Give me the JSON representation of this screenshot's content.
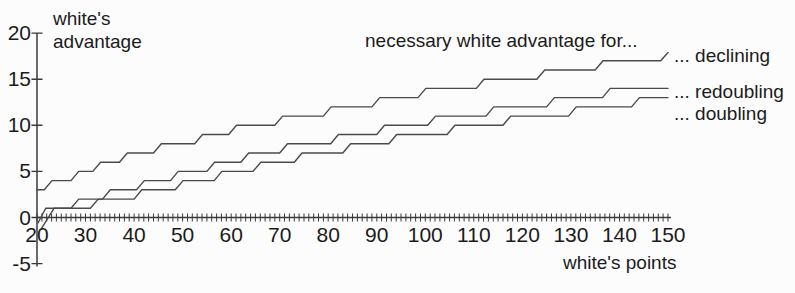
{
  "colors": {
    "background": "#fcfcfc",
    "curve": "#4a4a4a",
    "axis": "#3a3a3a",
    "text": "#1b1b1b"
  },
  "chart_data": {
    "type": "line",
    "title": "necessary white advantage for...",
    "xlabel": "white's points",
    "ylabel_line1": "white's",
    "ylabel_line2": "advantage",
    "xlim": [
      20,
      150
    ],
    "ylim": [
      -5,
      20
    ],
    "grid": false,
    "x_major_ticks": [
      20,
      30,
      40,
      50,
      60,
      70,
      80,
      90,
      100,
      110,
      120,
      130,
      140,
      150
    ],
    "x_major_tick_labels": [
      "20",
      "30",
      "40",
      "50",
      "60",
      "70",
      "80",
      "90",
      "100",
      "110",
      "120",
      "130",
      "140",
      "150"
    ],
    "x_minor_tick_step": 1,
    "y_ticks": [
      20,
      15,
      10,
      5,
      0,
      -5
    ],
    "y_tick_labels": [
      "20",
      "15",
      "10",
      "5",
      "0",
      "-5"
    ],
    "legend_position": "right of curve ends",
    "series": [
      {
        "name": "declining",
        "label": "... declining",
        "points": [
          [
            20,
            3
          ],
          [
            21.5,
            3
          ],
          [
            23.1,
            4
          ],
          [
            27,
            4
          ],
          [
            28.6,
            5
          ],
          [
            31.5,
            5
          ],
          [
            33.1,
            6
          ],
          [
            37,
            6
          ],
          [
            38.6,
            7
          ],
          [
            44,
            7
          ],
          [
            45.6,
            8
          ],
          [
            52.5,
            8
          ],
          [
            54.1,
            9
          ],
          [
            59.5,
            9
          ],
          [
            61.1,
            10
          ],
          [
            69,
            10
          ],
          [
            70.6,
            11
          ],
          [
            79,
            11
          ],
          [
            80.6,
            12
          ],
          [
            89,
            12
          ],
          [
            90.6,
            13
          ],
          [
            98.5,
            13
          ],
          [
            100.1,
            14
          ],
          [
            110.5,
            14
          ],
          [
            112.1,
            15
          ],
          [
            123,
            15
          ],
          [
            124.6,
            16
          ],
          [
            135,
            16
          ],
          [
            136.6,
            17
          ],
          [
            148.5,
            17
          ],
          [
            150,
            17.9
          ]
        ]
      },
      {
        "name": "redoubling",
        "label": "... redoubling",
        "points": [
          [
            20.2,
            -0.6
          ],
          [
            21.8,
            1
          ],
          [
            27,
            1
          ],
          [
            28.6,
            2
          ],
          [
            33.5,
            2
          ],
          [
            35.1,
            3
          ],
          [
            40.5,
            3
          ],
          [
            42.1,
            4
          ],
          [
            47.5,
            4
          ],
          [
            49.1,
            5
          ],
          [
            55,
            5
          ],
          [
            56.6,
            6
          ],
          [
            62,
            6
          ],
          [
            63.6,
            7
          ],
          [
            70,
            7
          ],
          [
            71.6,
            8
          ],
          [
            80.5,
            8
          ],
          [
            82.1,
            9
          ],
          [
            90,
            9
          ],
          [
            91.6,
            10
          ],
          [
            100.5,
            10
          ],
          [
            102.1,
            11
          ],
          [
            112.5,
            11
          ],
          [
            114.1,
            12
          ],
          [
            125,
            12
          ],
          [
            126.6,
            13
          ],
          [
            136.5,
            13
          ],
          [
            138.1,
            14
          ],
          [
            150,
            14
          ]
        ]
      },
      {
        "name": "doubling",
        "label": "... doubling",
        "points": [
          [
            20.9,
            -1.2
          ],
          [
            23.5,
            1
          ],
          [
            31,
            1
          ],
          [
            32.6,
            2
          ],
          [
            40,
            2
          ],
          [
            41.6,
            3
          ],
          [
            48.5,
            3
          ],
          [
            50.1,
            4
          ],
          [
            56.5,
            4
          ],
          [
            58.1,
            5
          ],
          [
            64.5,
            5
          ],
          [
            66.1,
            6
          ],
          [
            73,
            6
          ],
          [
            74.6,
            7
          ],
          [
            83,
            7
          ],
          [
            84.6,
            8
          ],
          [
            92.5,
            8
          ],
          [
            94.1,
            9
          ],
          [
            104.5,
            9
          ],
          [
            106.1,
            10
          ],
          [
            116,
            10
          ],
          [
            117.6,
            11
          ],
          [
            129.5,
            11
          ],
          [
            131.1,
            12
          ],
          [
            142.5,
            12
          ],
          [
            144.1,
            13
          ],
          [
            150,
            13
          ]
        ]
      }
    ]
  }
}
